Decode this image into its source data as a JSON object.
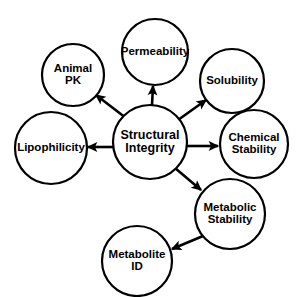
{
  "diagram": {
    "type": "hub-and-spoke-node-graph",
    "background_color": "#ffffff",
    "stroke_color": "#000000",
    "text_color": "#000000",
    "center_node": {
      "id": "structural-integrity",
      "label_line1": "Structural",
      "label_line2": "Integrity",
      "label_full": "Structural Integrity",
      "cx": 150,
      "cy": 142,
      "r": 37,
      "stroke_width": 2.2,
      "font_size": 12.5,
      "line_gap": 13.5
    },
    "nodes": [
      {
        "id": "permeability",
        "label_line1": "Permeability",
        "label_line2": "",
        "label_full": "Permeability",
        "cx": 155,
        "cy": 52,
        "r": 33,
        "stroke_width": 2.2,
        "font_size": 11.5,
        "line_gap": 0
      },
      {
        "id": "animal-pk",
        "label_line1": "Animal",
        "label_line2": "PK",
        "label_full": "Animal PK",
        "cx": 73,
        "cy": 75,
        "r": 31,
        "stroke_width": 2.2,
        "font_size": 11.5,
        "line_gap": 12.5
      },
      {
        "id": "solubility",
        "label_cline1": "Solubility",
        "label_line1": "Solubility",
        "label_line2": "",
        "label_full": "Solubility",
        "cx": 232,
        "cy": 81,
        "r": 32,
        "stroke_width": 2.2,
        "font_size": 11.5,
        "line_gap": 0
      },
      {
        "id": "lipophilicity",
        "label_line1": "Lipophilicity",
        "label_line2": "",
        "label_full": "Lipophilicity",
        "cx": 51,
        "cy": 148,
        "r": 36,
        "stroke_width": 2.2,
        "font_size": 11.5,
        "line_gap": 0
      },
      {
        "id": "chemical-stability",
        "label_line1": "Chemical",
        "label_line2": "Stability",
        "label_full": "Chemical Stability",
        "cx": 254,
        "cy": 144,
        "r": 34,
        "stroke_width": 2.2,
        "font_size": 11.5,
        "line_gap": 12.5
      },
      {
        "id": "metabolic-stability",
        "label_line1": "Metabolic",
        "label_line2": "Stability",
        "label_full": "Metabolic Stability",
        "cx": 230,
        "cy": 214,
        "r": 35,
        "stroke_width": 2.2,
        "font_size": 11.5,
        "line_gap": 12.5
      },
      {
        "id": "metabolite-id",
        "label_line1": "Metabolite",
        "label_line2": "ID",
        "label_full": "Metabolite ID",
        "cx": 137,
        "cy": 261,
        "r": 35,
        "stroke_width": 2.2,
        "font_size": 11.5,
        "line_gap": 12.5
      }
    ],
    "edges": [
      {
        "id": "edge-center-to-permeability",
        "from": "structural-integrity",
        "to": "permeability",
        "x1": 152,
        "y1": 105,
        "x2": 153,
        "y2": 86,
        "stroke_width": 2.6,
        "arrowhead": "end",
        "direction": "up"
      },
      {
        "id": "edge-center-to-animal-pk",
        "from": "structural-integrity",
        "to": "animal-pk",
        "x1": 126,
        "y1": 118,
        "x2": 96,
        "y2": 95,
        "stroke_width": 2.6,
        "arrowhead": "end",
        "direction": "up-left"
      },
      {
        "id": "edge-center-to-solubility",
        "from": "structural-integrity",
        "to": "solubility",
        "x1": 178,
        "y1": 120,
        "x2": 206,
        "y2": 100,
        "stroke_width": 2.6,
        "arrowhead": "end",
        "direction": "up-right"
      },
      {
        "id": "edge-center-to-lipophilicity",
        "from": "structural-integrity",
        "to": "lipophilicity",
        "x1": 113,
        "y1": 147,
        "x2": 88,
        "y2": 147,
        "stroke_width": 2.6,
        "arrowhead": "end",
        "direction": "left"
      },
      {
        "id": "edge-center-to-chemical-stability",
        "from": "structural-integrity",
        "to": "chemical-stability",
        "x1": 187,
        "y1": 146,
        "x2": 218,
        "y2": 146,
        "stroke_width": 2.6,
        "arrowhead": "end",
        "direction": "right"
      },
      {
        "id": "edge-center-to-metabolic-stability",
        "from": "structural-integrity",
        "to": "metabolic-stability",
        "x1": 175,
        "y1": 168,
        "x2": 201,
        "y2": 190,
        "stroke_width": 2.6,
        "arrowhead": "end",
        "direction": "down-right"
      },
      {
        "id": "edge-metabolic-stability-to-metabolite-id",
        "from": "metabolic-stability",
        "to": "metabolite-id",
        "x1": 203,
        "y1": 236,
        "x2": 172,
        "y2": 249,
        "stroke_width": 2.6,
        "arrowhead": "end",
        "direction": "down-left"
      }
    ]
  }
}
